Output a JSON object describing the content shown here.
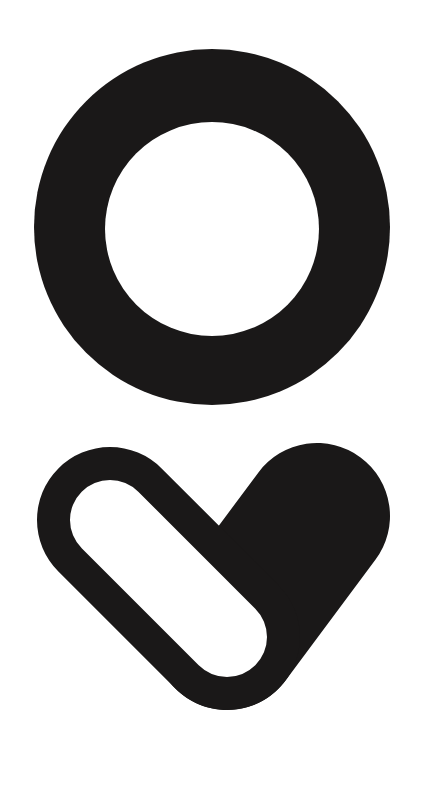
{
  "image": {
    "description": "Black logo mark: a thick ring above a heart-shaped mark formed by an outlined capsule and a solid lobe",
    "background_color": "#ffffff",
    "foreground_color": "#1a1818"
  },
  "ring": {
    "name": "ring-mark",
    "cx": 212,
    "cy": 227,
    "outer_r": 178,
    "inner_r": 107
  },
  "heart": {
    "name": "heart-capsule-mark",
    "capsule_top_center": [
      110,
      520
    ],
    "capsule_bottom_center": [
      227,
      637
    ],
    "lobe_center": [
      317,
      516
    ],
    "outer_r": 73,
    "inner_r": 40
  }
}
